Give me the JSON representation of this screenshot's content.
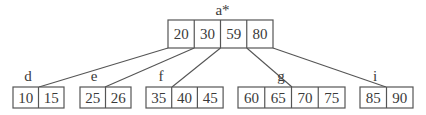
{
  "diagram": {
    "type": "b-tree",
    "root": {
      "label": "a*",
      "keys": [
        "20",
        "30",
        "59",
        "80"
      ]
    },
    "children": [
      {
        "label": "d",
        "keys": [
          "10",
          "15"
        ],
        "parent_pointer_index": 0
      },
      {
        "label": "e",
        "keys": [
          "25",
          "26"
        ],
        "parent_pointer_index": 1
      },
      {
        "label": "f",
        "keys": [
          "35",
          "40",
          "45"
        ],
        "parent_pointer_index": 2
      },
      {
        "label": "g",
        "keys": [
          "60",
          "65",
          "70",
          "75"
        ],
        "parent_pointer_index": 3
      },
      {
        "label": "i",
        "keys": [
          "85",
          "90"
        ],
        "parent_pointer_index": 4
      }
    ],
    "colors": {
      "stroke": "#555555",
      "text": "#3a3a3a",
      "background": "#ffffff"
    }
  }
}
